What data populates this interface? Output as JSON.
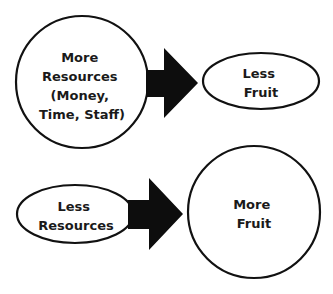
{
  "diagram": {
    "colors": {
      "stroke": "#111111",
      "fill": "#ffffff",
      "arrow": "#0d0d0d",
      "text": "#1a1a1a"
    },
    "top_row": {
      "source": {
        "shape": "circle",
        "lines": [
          "More",
          "Resources",
          "(Money,",
          "Time, Staff)"
        ]
      },
      "arrow": {
        "direction": "right"
      },
      "target": {
        "shape": "ellipse",
        "lines": [
          "Less",
          "Fruit"
        ]
      }
    },
    "bottom_row": {
      "source": {
        "shape": "ellipse",
        "lines": [
          "Less",
          "Resources"
        ]
      },
      "arrow": {
        "direction": "right"
      },
      "target": {
        "shape": "circle",
        "lines": [
          "More",
          "Fruit"
        ]
      }
    }
  }
}
